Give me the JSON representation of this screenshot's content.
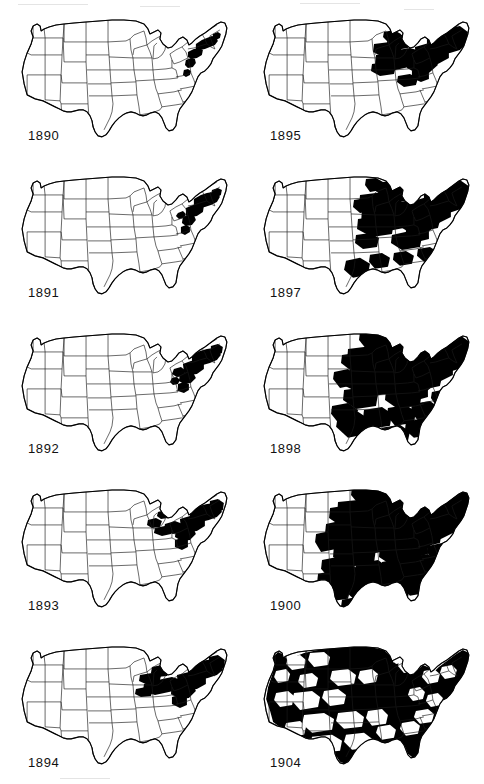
{
  "figure": {
    "kind": "small-multiples-choropleth-series",
    "columns": 2,
    "rows": 5,
    "background_color": "#ffffff",
    "adopted_color": "#000000",
    "unadopted_color": "#ffffff",
    "border_color": "#1a1a1a"
  },
  "chart_data": {
    "type": "heatmap",
    "subtitle": "",
    "xlabel": "",
    "ylabel": "",
    "legend": [],
    "grid": false,
    "categories": [
      "1890",
      "1891",
      "1892",
      "1893",
      "1894",
      "1895",
      "1897",
      "1898",
      "1900",
      "1904"
    ],
    "values": [
      4,
      6,
      8,
      11,
      14,
      20,
      38,
      52,
      64,
      88
    ],
    "series": [
      {
        "name": "approximate share of national territory shaded black (%)",
        "values": [
          4,
          6,
          8,
          11,
          14,
          20,
          38,
          52,
          64,
          88
        ]
      }
    ],
    "ylim": [
      0,
      100
    ],
    "annotations": [
      "Shading begins in the Northeast megalopolis corridor (New York, New Jersey, eastern Pennsylvania, southern New England) in 1890.",
      "By 1895 the shaded zone reaches the lower Great Lakes: Ohio, Indiana, lower Michigan and eastern Illinois.",
      "In 1897 outliers appear in eastern Texas, Louisiana, Iowa, Minnesota and the Carolinas.",
      "By 1898 the shading covers most of the Midwest and Upper South east of the Great Plains.",
      "By 1900 nearly all territory east of the 100th meridian is shaded, with the Plains states still largely open.",
      "By 1904 shading covers almost the entire country including the Mountain West and Pacific Coast; only scattered interior basins remain unshaded."
    ]
  },
  "panels": [
    {
      "id": "panel-1890",
      "year": "1890",
      "column": "left",
      "row": 1,
      "coverage_percent": 4,
      "regions_shaded": [
        "New York metropolitan area",
        "northern New Jersey",
        "eastern Pennsylvania",
        "southern New England",
        "Baltimore-Washington corridor"
      ]
    },
    {
      "id": "panel-1891",
      "year": "1891",
      "column": "left",
      "row": 2,
      "coverage_percent": 6,
      "regions_shaded": [
        "Northeast corridor",
        "eastern Pennsylvania",
        "Massachusetts",
        "Rhode Island",
        "Connecticut",
        "Maryland"
      ]
    },
    {
      "id": "panel-1892",
      "year": "1892",
      "column": "left",
      "row": 3,
      "coverage_percent": 8,
      "regions_shaded": [
        "Northeast corridor",
        "upstate New York",
        "eastern Pennsylvania",
        "southern New England",
        "Chesapeake"
      ]
    },
    {
      "id": "panel-1893",
      "year": "1893",
      "column": "left",
      "row": 4,
      "coverage_percent": 11,
      "regions_shaded": [
        "Northeast corridor",
        "western New York",
        "northern Ohio",
        "northern Indiana",
        "southern Michigan",
        "Chesapeake"
      ]
    },
    {
      "id": "panel-1894",
      "year": "1894",
      "column": "left",
      "row": 5,
      "coverage_percent": 14,
      "regions_shaded": [
        "Northeast corridor",
        "Lake Erie shore",
        "northern Ohio",
        "northern Indiana",
        "southern Michigan",
        "northern Illinois",
        "Chesapeake"
      ]
    },
    {
      "id": "panel-1895",
      "year": "1895",
      "column": "right",
      "row": 1,
      "coverage_percent": 20,
      "regions_shaded": [
        "Northeast corridor",
        "New England",
        "Ohio",
        "Indiana",
        "lower Michigan",
        "eastern Illinois",
        "Wisconsin",
        "Chesapeake"
      ]
    },
    {
      "id": "panel-1897",
      "year": "1897",
      "column": "right",
      "row": 2,
      "coverage_percent": 38,
      "regions_shaded": [
        "Northeast",
        "Great Lakes",
        "Iowa",
        "Minnesota",
        "Missouri",
        "eastern Texas",
        "Louisiana",
        "Mississippi",
        "Carolinas",
        "Virginia"
      ]
    },
    {
      "id": "panel-1898",
      "year": "1898",
      "column": "right",
      "row": 3,
      "coverage_percent": 52,
      "regions_shaded": [
        "Northeast",
        "Great Lakes",
        "Upper Midwest",
        "Missouri valley",
        "mid-South",
        "Gulf Coast",
        "Southeast",
        "eastern Texas"
      ]
    },
    {
      "id": "panel-1900",
      "year": "1900",
      "column": "right",
      "row": 4,
      "coverage_percent": 64,
      "regions_shaded": [
        "all territory east of the 100th meridian",
        "eastern Dakotas",
        "Nebraska",
        "Kansas",
        "Oklahoma",
        "Texas",
        "Deep South",
        "Atlantic seaboard"
      ]
    },
    {
      "id": "panel-1904",
      "year": "1904",
      "column": "right",
      "row": 5,
      "coverage_percent": 88,
      "regions_shaded": [
        "nearly the entire conterminous United States",
        "Pacific Northwest",
        "California",
        "Mountain West",
        "Great Plains",
        "East",
        "South"
      ]
    }
  ]
}
